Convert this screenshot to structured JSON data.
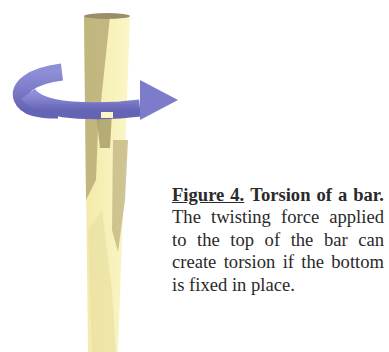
{
  "figure": {
    "label": "Figure 4.",
    "title": "Torsion of a bar.",
    "body": "The twisting force applied to the top of the bar can create torsion if the bottom is fixed in place."
  },
  "illustration": {
    "subject": "bar",
    "indicator": "twist-arrow",
    "colors": {
      "bar_light": "#f7f0b0",
      "bar_shadow": "#b9ad78",
      "arrow": "#7878c6",
      "arrow_dark": "#5a5aa8"
    }
  }
}
